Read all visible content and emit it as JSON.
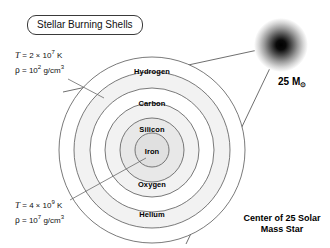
{
  "figure": {
    "title_box": "Stellar Burning Shells",
    "background_color": "#ffffff",
    "line_color": "#4a4a4a"
  },
  "conditions": {
    "outer": {
      "temperature_symbol": "T",
      "temperature_eq": "=",
      "temperature_mantissa": "2",
      "temperature_times": "×",
      "temperature_base": "10",
      "temperature_exponent": "7",
      "temperature_unit": "K",
      "density_symbol": "ρ",
      "density_eq": "=",
      "density_base": "10",
      "density_exponent": "2",
      "density_unit": "g/cm",
      "density_unit_exponent": "3"
    },
    "inner": {
      "temperature_symbol": "T",
      "temperature_eq": "=",
      "temperature_mantissa": "4",
      "temperature_times": "×",
      "temperature_base": "10",
      "temperature_exponent": "9",
      "temperature_unit": "K",
      "density_symbol": "ρ",
      "density_eq": "=",
      "density_base": "10",
      "density_exponent": "7",
      "density_unit": "g/cm",
      "density_unit_exponent": "3"
    }
  },
  "shells": [
    {
      "name": "Hydrogen",
      "radius": 93,
      "fill": "#ffffff",
      "label_x": 152,
      "label_y": 71
    },
    {
      "name": "Helium",
      "radius": 78,
      "fill": "#f2f2f2",
      "label_x": 152,
      "label_y": 214
    },
    {
      "name": "Carbon",
      "radius": 62,
      "fill": "#ffffff",
      "label_x": 152,
      "label_y": 103
    },
    {
      "name": "Oxygen",
      "radius": 47,
      "fill": "#f2f2f2",
      "label_x": 152,
      "label_y": 184
    },
    {
      "name": "Silicon",
      "radius": 32,
      "fill": "#e8e8e8",
      "label_x": 152,
      "label_y": 129
    },
    {
      "name": "Iron",
      "radius": 17,
      "fill": "#e0e0e0",
      "label_x": 152,
      "label_y": 151
    }
  ],
  "star": {
    "center_x": 281,
    "center_y": 45,
    "radius": 27,
    "mass_label": "25 M",
    "mass_subscript": "⊙"
  },
  "caption": {
    "line1": "Center of 25 Solar",
    "line2": "Mass Star"
  }
}
